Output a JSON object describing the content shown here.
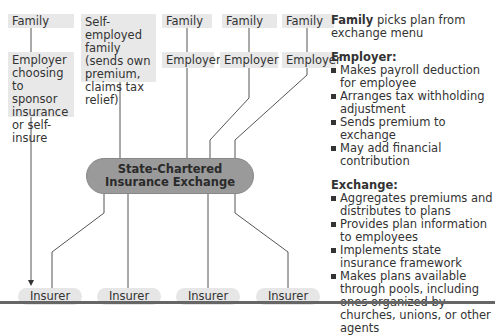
{
  "diagram": {
    "top_row": [
      {
        "label": "Family"
      },
      {
        "label": "Self-employed family (sends own premium, claims tax relief)"
      },
      {
        "label": "Family"
      },
      {
        "label": "Family"
      },
      {
        "label": "Family"
      }
    ],
    "second_row": [
      {
        "label": "Employer choosing to sponsor insurance or self-insure"
      },
      {
        "label": "Employer"
      },
      {
        "label": "Employer"
      },
      {
        "label": "Employer"
      }
    ],
    "exchange": {
      "line1": "State-Chartered",
      "line2": "Insurance Exchange",
      "color": "#9a9a9a"
    },
    "insurers": [
      {
        "label": "Insurer"
      },
      {
        "label": "Insurer"
      },
      {
        "label": "Insurer"
      },
      {
        "label": "Insurer"
      }
    ]
  },
  "legend": {
    "family": {
      "bold": "Family",
      "rest": " picks plan from exchange menu"
    },
    "employer": {
      "heading": "Employer:",
      "items": [
        "Makes payroll deduction for employee",
        "Arranges tax withholding adjustment",
        "Sends premium to exchange",
        "May add financial contribution"
      ]
    },
    "exchange": {
      "heading": "Exchange:",
      "items": [
        "Aggregates premiums and distributes to plans",
        "Provides plan information to employees",
        "Implements state insurance framework",
        "Makes plans available through pools, including ones organized by churches, unions, or other agents"
      ]
    }
  }
}
